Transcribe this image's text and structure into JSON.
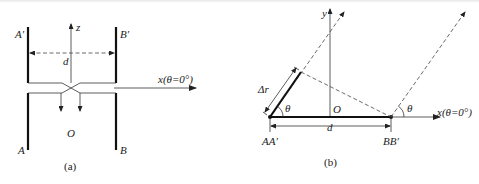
{
  "figure": {
    "panel_a": {
      "caption": "(a)",
      "labels": {
        "a_prime": "A′",
        "b_prime": "B′",
        "a": "A",
        "b": "B",
        "z_axis": "z",
        "x_axis": "x(θ=0°)",
        "separation": "d",
        "origin": "O"
      }
    },
    "panel_b": {
      "caption": "(b)",
      "labels": {
        "y_axis": "y",
        "x_axis": "x(θ=0°)",
        "origin": "O",
        "separation": "d",
        "delta_r": "Δr",
        "theta_left": "θ",
        "theta_right": "θ",
        "point_left": "AA′",
        "point_right": "BB′"
      }
    }
  }
}
